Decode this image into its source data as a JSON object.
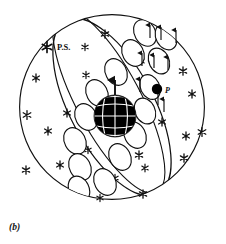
{
  "figure": {
    "caption": "(b)",
    "title_hidden": "",
    "labels": {
      "pole_star": "P.S.",
      "point_p": "P"
    },
    "colors": {
      "ink": "#111111",
      "background": "#ffffff",
      "globe_fill": "#000000",
      "globe_grid": "#ffffff",
      "point_fill": "#000000"
    },
    "celestial_sphere": {
      "center_x": 112,
      "center_y": 107,
      "radius": 93,
      "stroke_width": 1.1
    },
    "orbital_band": {
      "center_x": 112,
      "center_y": 107,
      "semi_major": 92,
      "semi_minor": 37,
      "rotation_deg": -28,
      "stroke_width": 1.2,
      "loop_count": 15
    },
    "globe": {
      "center_x": 115,
      "center_y": 116,
      "radius": 21,
      "grid_meridians": 5,
      "grid_parallels": 4
    },
    "point_p": {
      "x": 157,
      "y": 89,
      "radius": 5.2,
      "label_x": 165,
      "label_y": 92
    },
    "pole_star": {
      "star_x": 47,
      "star_y": 47,
      "star_size": 7.5,
      "label_x": 56,
      "label_y": 50
    },
    "arrow_up_globe": {
      "x": 115,
      "y_top": 80,
      "y_bottom": 94
    },
    "background_stars": [
      {
        "x": 105,
        "y": 34,
        "size": 4.2
      },
      {
        "x": 85,
        "y": 47,
        "size": 3.6
      },
      {
        "x": 36,
        "y": 78,
        "size": 4.0
      },
      {
        "x": 86,
        "y": 75,
        "size": 3.6
      },
      {
        "x": 27,
        "y": 115,
        "size": 4.4
      },
      {
        "x": 48,
        "y": 131,
        "size": 4.0
      },
      {
        "x": 67,
        "y": 113,
        "size": 4.0
      },
      {
        "x": 26,
        "y": 170,
        "size": 4.2
      },
      {
        "x": 60,
        "y": 165,
        "size": 4.0
      },
      {
        "x": 88,
        "y": 150,
        "size": 3.6
      },
      {
        "x": 141,
        "y": 61,
        "size": 3.8
      },
      {
        "x": 183,
        "y": 71,
        "size": 4.2
      },
      {
        "x": 192,
        "y": 94,
        "size": 4.0
      },
      {
        "x": 146,
        "y": 113,
        "size": 3.8
      },
      {
        "x": 162,
        "y": 122,
        "size": 4.0
      },
      {
        "x": 202,
        "y": 132,
        "size": 4.4
      },
      {
        "x": 186,
        "y": 136,
        "size": 4.0
      },
      {
        "x": 139,
        "y": 155,
        "size": 4.2
      },
      {
        "x": 184,
        "y": 158,
        "size": 4.2
      },
      {
        "x": 145,
        "y": 168,
        "size": 3.8
      },
      {
        "x": 143,
        "y": 194,
        "size": 4.2
      },
      {
        "x": 115,
        "y": 178,
        "size": 3.6
      },
      {
        "x": 100,
        "y": 198,
        "size": 3.6
      }
    ],
    "band_loops": [
      {
        "cx": 145,
        "cy": 33,
        "rx": 10.5,
        "ry": 14.0,
        "rot": -30
      },
      {
        "cx": 166,
        "cy": 37,
        "rx": 10.0,
        "ry": 13.5,
        "rot": -28
      },
      {
        "cx": 133,
        "cy": 53,
        "rx": 10.5,
        "ry": 14.0,
        "rot": -28
      },
      {
        "cx": 159,
        "cy": 61,
        "rx": 10.0,
        "ry": 13.5,
        "rot": -26
      },
      {
        "cx": 116,
        "cy": 72,
        "rx": 10.5,
        "ry": 14.0,
        "rot": -28
      },
      {
        "cx": 150,
        "cy": 87,
        "rx": 9.5,
        "ry": 13.0,
        "rot": -26
      },
      {
        "cx": 97,
        "cy": 93,
        "rx": 10.5,
        "ry": 14.0,
        "rot": -28
      },
      {
        "cx": 145,
        "cy": 111,
        "rx": 10.0,
        "ry": 13.5,
        "rot": -26
      },
      {
        "cx": 86,
        "cy": 117,
        "rx": 10.5,
        "ry": 14.0,
        "rot": -28
      },
      {
        "cx": 135,
        "cy": 135,
        "rx": 10.5,
        "ry": 14.0,
        "rot": -28
      },
      {
        "cx": 75,
        "cy": 141,
        "rx": 10.5,
        "ry": 14.0,
        "rot": -28
      },
      {
        "cx": 120,
        "cy": 157,
        "rx": 10.5,
        "ry": 14.0,
        "rot": -28
      },
      {
        "cx": 80,
        "cy": 167,
        "rx": 10.5,
        "ry": 14.0,
        "rot": -28
      },
      {
        "cx": 105,
        "cy": 182,
        "rx": 10.5,
        "ry": 14.0,
        "rot": -28
      },
      {
        "cx": 79,
        "cy": 189,
        "rx": 10.0,
        "ry": 13.5,
        "rot": -26
      }
    ],
    "loop_arrows": [
      {
        "x": 151,
        "y1": 24,
        "y2": 38,
        "dir": "up"
      },
      {
        "x": 176,
        "y1": 28,
        "y2": 42,
        "dir": "up"
      },
      {
        "x": 162,
        "y1": 26,
        "y2": 40,
        "dir": "up"
      },
      {
        "x": 142,
        "y1": 52,
        "y2": 66,
        "dir": "up"
      },
      {
        "x": 168,
        "y1": 55,
        "y2": 69,
        "dir": "up"
      },
      {
        "x": 155,
        "y1": 54,
        "y2": 68,
        "dir": "up"
      },
      {
        "x": 158,
        "y1": 80,
        "y2": 94,
        "dir": "up"
      },
      {
        "x": 163,
        "y1": 98,
        "y2": 112,
        "dir": "up"
      }
    ]
  }
}
